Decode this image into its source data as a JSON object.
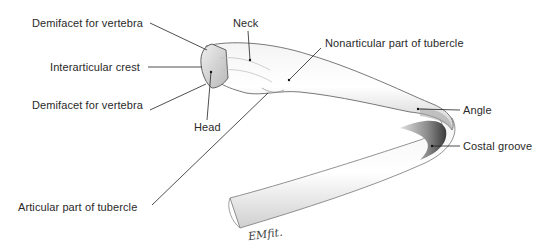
{
  "figure": {
    "labels": [
      {
        "id": "demifacet-upper",
        "text": "Demifacet for vertebra"
      },
      {
        "id": "interarticular-crest",
        "text": "Interarticular crest"
      },
      {
        "id": "demifacet-lower",
        "text": "Demifacet for vertebra"
      },
      {
        "id": "head",
        "text": "Head"
      },
      {
        "id": "neck",
        "text": "Neck"
      },
      {
        "id": "nonarticular-tubercle",
        "text": "Nonarticular part of tubercle"
      },
      {
        "id": "angle",
        "text": "Angle"
      },
      {
        "id": "costal-groove",
        "text": "Costal groove"
      },
      {
        "id": "articular-tubercle",
        "text": "Articular part of tubercle"
      }
    ],
    "signature": "EMfit."
  }
}
